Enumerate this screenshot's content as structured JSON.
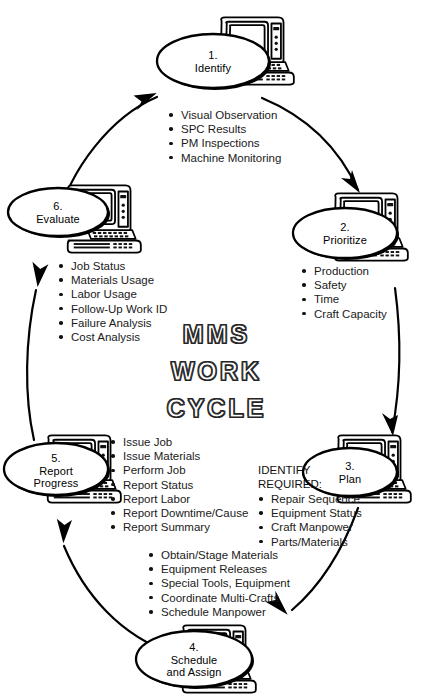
{
  "diagram": {
    "center_title": {
      "lines": [
        "MMS",
        "WORK",
        "CYCLE"
      ]
    },
    "nodes": [
      {
        "number": "1.",
        "name": "Identify",
        "icon": "desktop-computer-icon"
      },
      {
        "number": "2.",
        "name": "Prioritize",
        "icon": "desktop-computer-icon"
      },
      {
        "number": "3.",
        "name": "Plan",
        "icon": "desktop-computer-icon"
      },
      {
        "number": "4.",
        "name": "Schedule",
        "name2": "and Assign",
        "icon": "desktop-computer-icon"
      },
      {
        "number": "5.",
        "name": "Report",
        "name2": "Progress",
        "icon": "desktop-computer-icon"
      },
      {
        "number": "6.",
        "name": "Evaluate",
        "icon": "desktop-computer-icon"
      }
    ],
    "lists": {
      "identify": [
        "Visual Observation",
        "SPC Results",
        "PM Inspections",
        "Machine Monitoring"
      ],
      "prioritize": [
        "Production",
        "Safety",
        "Time",
        "Craft Capacity"
      ],
      "plan_heading": [
        "IDENTIFY",
        "REQUIRED:"
      ],
      "plan": [
        "Repair Sequence",
        "Equipment Status",
        "Craft Manpower",
        "Parts/Materials"
      ],
      "schedule_and_assign": [
        "Obtain/Stage Materials",
        "Equipment Releases",
        "Special Tools, Equipment",
        "Coordinate Multi-Crafts",
        "Schedule Manpower"
      ],
      "report_progress": [
        "Issue Job",
        "Issue Materials",
        "Perform Job",
        "Report Status",
        "Report Labor",
        "Report Downtime/Cause",
        "Report Summary"
      ],
      "evaluate": [
        "Job Status",
        "Materials Usage",
        "Labor Usage",
        "Follow-Up Work ID",
        "Failure Analysis",
        "Cost Analysis"
      ]
    },
    "colors": {
      "ink": "#000000",
      "background": "#ffffff",
      "title_outline": "#2a2a2a"
    }
  }
}
